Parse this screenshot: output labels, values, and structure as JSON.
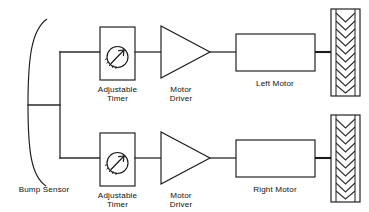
{
  "diagram": {
    "background_color": "#ffffff",
    "line_color": "#1a1a1a",
    "text_color": "#111111",
    "sensor": {
      "name": "bump-sensor",
      "label": "Bump Sensor",
      "shape": "curved-arc"
    },
    "branches": [
      {
        "side": "top",
        "timer_label_line1": "Adjustable",
        "timer_label_line2": "Timer",
        "driver_label_line1": "Motor",
        "driver_label_line2": "Driver",
        "motor_label": "Left Motor",
        "wheel_name": "left-wheel"
      },
      {
        "side": "bottom",
        "timer_label_line1": "Adjustable",
        "timer_label_line2": "Timer",
        "driver_label_line1": "Motor",
        "driver_label_line2": "Driver",
        "motor_label": "Right Motor",
        "wheel_name": "right-wheel"
      }
    ]
  }
}
